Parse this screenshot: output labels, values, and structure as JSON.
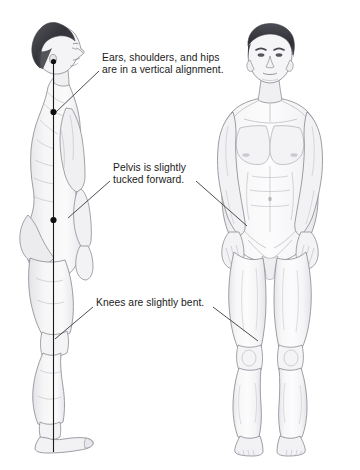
{
  "illustration": {
    "title": "Standing posture alignment reference",
    "background_color": "#ffffff",
    "figures": [
      {
        "name": "lateral-view-male-figure",
        "orientation": "side profile facing right",
        "plumb_line": {
          "color": "#1a1a1a",
          "markers": [
            "ear",
            "shoulder",
            "hip"
          ]
        }
      },
      {
        "name": "anterior-view-male-figure",
        "orientation": "front facing",
        "plumb_line": null
      }
    ]
  },
  "callouts": [
    {
      "id": "alignment",
      "line1": "Ears, shoulders, and hips",
      "line2": "are in a vertical alignment.",
      "leader_targets": [
        "lateral-shoulder-marker"
      ]
    },
    {
      "id": "pelvis",
      "line1": "Pelvis is slightly",
      "line2": "tucked forward.",
      "leader_targets": [
        "lateral-pelvis",
        "anterior-pelvis"
      ]
    },
    {
      "id": "knees",
      "line1": "Knees are slightly bent.",
      "line2": "",
      "leader_targets": [
        "lateral-knee",
        "anterior-knee"
      ]
    }
  ],
  "colors": {
    "text": "#1b1b1b",
    "leader_line": "#3a3a3a",
    "plumb_line": "#1a1a1a",
    "marker_dot": "#101010",
    "skin_fill": "#f7f7f8",
    "skin_outline": "#8c8c92",
    "muscle_shading": "#d9d9de",
    "hair_dark": "#3a3a3f",
    "hair_light": "#6d6d74"
  }
}
